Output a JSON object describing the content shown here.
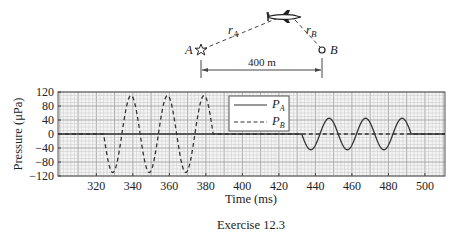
{
  "diagram": {
    "source_label": "A",
    "receiver_label": "B",
    "path_a_label": "r",
    "path_a_sub": "A",
    "path_b_label": "r",
    "path_b_sub": "B",
    "distance_label": "400 m",
    "source_icon": "star-icon",
    "receiver_icon": "circle-icon",
    "aircraft_icon": "aircraft-icon"
  },
  "caption": "Exercise 12.3",
  "chart_data": {
    "type": "line",
    "title": "",
    "xlabel": "Time (ms)",
    "ylabel": "Pressure (μPa)",
    "xlim": [
      299,
      511
    ],
    "ylim": [
      -120,
      120
    ],
    "xticks": [
      320,
      340,
      360,
      380,
      400,
      420,
      440,
      460,
      480,
      500
    ],
    "yticks": [
      120,
      80,
      40,
      0,
      -40,
      -80,
      -120
    ],
    "ytick_labels": [
      "120",
      "80",
      "40",
      "0",
      "−40",
      "−80",
      "−120"
    ],
    "grid": true,
    "legend_position": "upper center",
    "series": [
      {
        "name": "P_A",
        "label_main": "P",
        "label_sub": "A",
        "style": "solid",
        "description": "Sinusoid, period 20 ms, amplitude ~45 μPa, nonzero from 432.5 to 492.5 ms, starts going negative",
        "x": [
          299,
          432.5,
          437.5,
          442.5,
          447.5,
          452.5,
          457.5,
          462.5,
          467.5,
          472.5,
          477.5,
          482.5,
          487.5,
          492.5,
          511
        ],
        "values": [
          0,
          0,
          -45,
          0,
          45,
          0,
          -45,
          0,
          45,
          0,
          -45,
          0,
          45,
          0,
          0
        ]
      },
      {
        "name": "P_B",
        "label_main": "P",
        "label_sub": "B",
        "style": "dashed",
        "description": "Sinusoid, period 20 ms, amplitude ~110 μPa, nonzero from 324 to 384 ms, starts going negative",
        "x": [
          299,
          324,
          329,
          334,
          339,
          344,
          349,
          354,
          359,
          364,
          369,
          374,
          379,
          384,
          511
        ],
        "values": [
          0,
          0,
          -110,
          0,
          110,
          0,
          -110,
          0,
          110,
          0,
          -110,
          0,
          110,
          0,
          0
        ]
      }
    ]
  }
}
